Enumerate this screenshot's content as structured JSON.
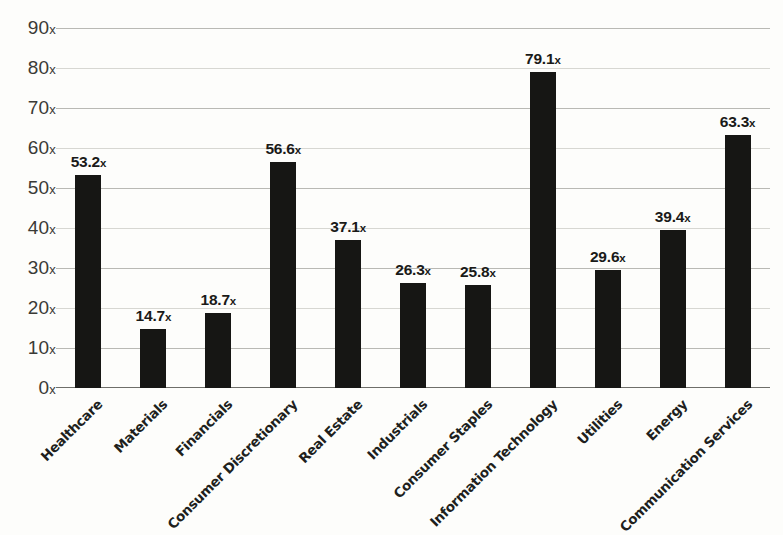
{
  "chart_data": {
    "type": "bar",
    "title": "",
    "subtitle": "",
    "xlabel": "",
    "ylabel": "",
    "ylim": [
      0,
      90
    ],
    "ytick_step": 10,
    "ytick_suffix": "x",
    "grid": true,
    "legend": false,
    "legend_position": "none",
    "bar_color": "#161614",
    "gridline_color": "#b9b9b4",
    "axis_color": "#6e6e69",
    "background_color": "#fdfdfb",
    "value_suffix": "x",
    "categories": [
      "Healthcare",
      "Materials",
      "Financials",
      "Consumer Discretionary",
      "Real Estate",
      "Industrials",
      "Consumer Staples",
      "Information Technology",
      "Utilities",
      "Energy",
      "Communication Services"
    ],
    "values": [
      53.2,
      14.7,
      18.7,
      56.6,
      37.1,
      26.3,
      25.8,
      79.1,
      29.6,
      39.4,
      63.3
    ],
    "value_labels": [
      "53.2x",
      "14.7x",
      "18.7x",
      "56.6x",
      "37.1x",
      "26.3x",
      "25.8x",
      "79.1x",
      "29.6x",
      "39.4x",
      "63.3x"
    ],
    "ytick_labels": [
      "0x",
      "10x",
      "20x",
      "30x",
      "40x",
      "50x",
      "60x",
      "70x",
      "80x",
      "90x"
    ],
    "ytick_values": [
      0,
      10,
      20,
      30,
      40,
      50,
      60,
      70,
      80,
      90
    ]
  }
}
